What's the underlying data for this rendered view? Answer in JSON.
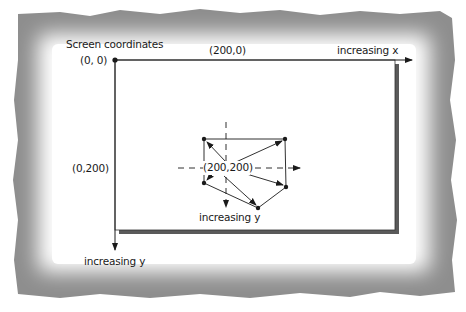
{
  "diagram": {
    "title": "Screen coordinates",
    "labels": {
      "origin": "(0, 0)",
      "x_mark": "(200,0)",
      "x_axis": "increasing x",
      "y_mark": "(0,200)",
      "center": "(200,200)",
      "inner_y_axis": "increasing y",
      "y_axis": "increasing y"
    },
    "colors": {
      "frame_outer": "#8a8a8a",
      "frame_inner": "#ffffff",
      "lines": "#1a1a1a",
      "shadow": "#5a5a5a"
    },
    "polygon": {
      "center": [
        226,
        168
      ],
      "vertices": [
        [
          204,
          139
        ],
        [
          285,
          139
        ],
        [
          286,
          187
        ],
        [
          258,
          208
        ],
        [
          204,
          183
        ]
      ]
    }
  }
}
